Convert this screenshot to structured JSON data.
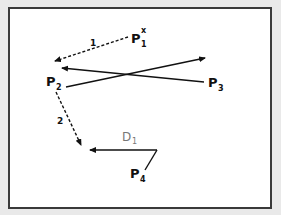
{
  "diagram": {
    "background_color": "#e9e9e9",
    "frame_color": "#3a3a3a",
    "points": {
      "p1x": {
        "base": "P",
        "sub": "1",
        "sup": "x"
      },
      "p2": {
        "base": "P",
        "sub": "2"
      },
      "p3": {
        "base": "P",
        "sub": "3"
      },
      "p4": {
        "base": "P",
        "sub": "4"
      }
    },
    "label_d1": {
      "base": "D",
      "sub": "1",
      "color": "#777777"
    },
    "dashed_arrows": [
      {
        "label": "1",
        "from": "P1x",
        "to": "P2"
      },
      {
        "label": "2",
        "from": "P2",
        "to": "D1 arrow tip"
      }
    ],
    "solid_arrows": [
      {
        "from": "P3",
        "to": "P2"
      },
      {
        "from": "P2",
        "to": "right"
      },
      {
        "from": "P4",
        "to": "left",
        "label": "D1"
      }
    ]
  }
}
